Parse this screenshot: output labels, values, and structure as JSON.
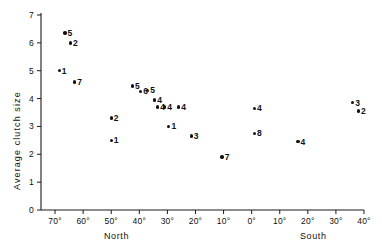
{
  "chart_data": {
    "type": "scatter",
    "title": "",
    "xlabel_left": "North",
    "xlabel_right": "South",
    "ylabel": "Average clutch size",
    "ylim": [
      0,
      7
    ],
    "xlim_deg": [
      75,
      -40
    ],
    "grid": false,
    "legend": "none",
    "y_ticks": [
      "0",
      "1",
      "2",
      "3",
      "4",
      "5",
      "6",
      "7"
    ],
    "y_tick_values": [
      0,
      1,
      2,
      3,
      4,
      5,
      6,
      7
    ],
    "x_ticks": [
      "70°",
      "60°",
      "50°",
      "40°",
      "30°",
      "20°",
      "10°",
      "0°",
      "10°",
      "20°",
      "30°",
      "40°"
    ],
    "x_tick_values": [
      70,
      60,
      50,
      40,
      30,
      20,
      10,
      0,
      -10,
      -20,
      -30,
      -40
    ],
    "points": [
      {
        "label": "5",
        "lat": 66.5,
        "y": 6.35
      },
      {
        "label": "2",
        "lat": 64.5,
        "y": 6.0
      },
      {
        "label": "1",
        "lat": 68.5,
        "y": 5.0
      },
      {
        "label": "7",
        "lat": 63.0,
        "y": 4.6
      },
      {
        "label": "2",
        "lat": 50.0,
        "y": 3.3
      },
      {
        "label": "1",
        "lat": 50.0,
        "y": 2.5
      },
      {
        "label": "5",
        "lat": 42.5,
        "y": 4.45
      },
      {
        "label": "6",
        "lat": 39.5,
        "y": 4.25
      },
      {
        "label": "5",
        "lat": 37.0,
        "y": 4.3
      },
      {
        "label": "4",
        "lat": 34.5,
        "y": 3.95
      },
      {
        "label": "4",
        "lat": 33.5,
        "y": 3.7
      },
      {
        "label": "4",
        "lat": 31.0,
        "y": 3.7
      },
      {
        "label": "1",
        "lat": 29.5,
        "y": 3.0
      },
      {
        "label": "4",
        "lat": 26.0,
        "y": 3.7
      },
      {
        "label": "3",
        "lat": 21.5,
        "y": 2.65
      },
      {
        "label": "7",
        "lat": 10.5,
        "y": 1.9
      },
      {
        "label": "4",
        "lat": -1.0,
        "y": 3.65
      },
      {
        "label": "8",
        "lat": -1.0,
        "y": 2.75
      },
      {
        "label": "4",
        "lat": -16.5,
        "y": 2.45
      },
      {
        "label": "3",
        "lat": -36.0,
        "y": 3.85
      },
      {
        "label": "2",
        "lat": -38.0,
        "y": 3.55
      }
    ]
  },
  "colors": {
    "axis": "#111111",
    "marker": "#111111",
    "background": "#ffffff"
  }
}
